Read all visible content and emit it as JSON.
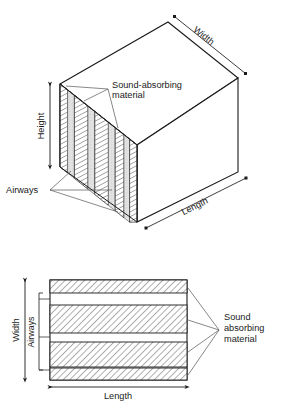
{
  "figure": {
    "upper": {
      "name": "isometric-duct-view",
      "labels": {
        "width": "Width",
        "height": "Height",
        "length": "Length",
        "absorber_line1": "Sound-absorbing",
        "absorber_line2": "material",
        "airways": "Airways"
      },
      "slab_count": 5,
      "airway_count": 4,
      "leader_counts": {
        "absorber": 3,
        "airways": 3
      }
    },
    "lower": {
      "name": "plan-section-view",
      "labels": {
        "width": "Width",
        "airways": "Airways",
        "length": "Length",
        "absorber_line1": "Sound",
        "absorber_line2": "absorbing",
        "absorber_line3": "material"
      },
      "band_count": 4,
      "airway_count": 3,
      "leader_counts": {
        "absorber": 4
      }
    },
    "caption": ""
  },
  "colors": {
    "line": "#1a1a1a",
    "leader": "#555555",
    "hatch": "#333333",
    "airway_fill": "#d9d9d9",
    "background": "#ffffff",
    "text": "#1a1a1a"
  }
}
